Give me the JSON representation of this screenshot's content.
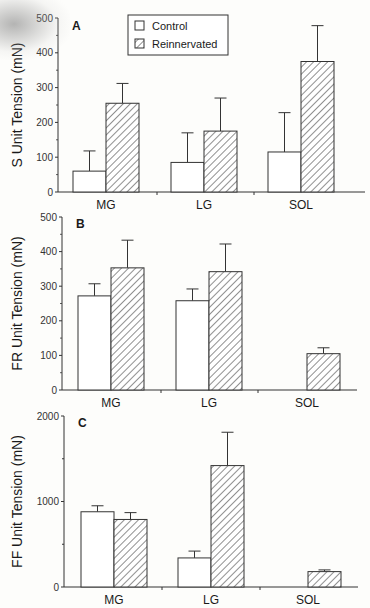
{
  "chart_data": [
    {
      "type": "bar",
      "panel": "A",
      "title": "",
      "xlabel": "",
      "ylabel": "S Unit Tension (mN)",
      "ylim": [
        0,
        500
      ],
      "yticks": [
        0,
        100,
        200,
        300,
        400,
        500
      ],
      "categories": [
        "MG",
        "LG",
        "SOL"
      ],
      "series": [
        {
          "name": "Control",
          "values": [
            60,
            85,
            115
          ],
          "error_upper": [
            118,
            170,
            228
          ]
        },
        {
          "name": "Reinnervated",
          "values": [
            255,
            175,
            375
          ],
          "error_upper": [
            312,
            270,
            478
          ]
        }
      ],
      "legend": {
        "position": "top-center",
        "entries": [
          "Control",
          "Reinnervated"
        ]
      },
      "grid": false
    },
    {
      "type": "bar",
      "panel": "B",
      "title": "",
      "xlabel": "",
      "ylabel": "FR Unit Tension (mN)",
      "ylim": [
        0,
        500
      ],
      "yticks": [
        0,
        100,
        200,
        300,
        400,
        500
      ],
      "categories": [
        "MG",
        "LG",
        "SOL"
      ],
      "series": [
        {
          "name": "Control",
          "values": [
            272,
            258,
            null
          ],
          "error_upper": [
            307,
            292,
            null
          ]
        },
        {
          "name": "Reinnervated",
          "values": [
            353,
            342,
            105
          ],
          "error_upper": [
            433,
            422,
            122
          ]
        }
      ],
      "grid": false
    },
    {
      "type": "bar",
      "panel": "C",
      "title": "",
      "xlabel": "",
      "ylabel": "FF Unit Tension (mN)",
      "ylim": [
        0,
        2000
      ],
      "yticks": [
        0,
        1000,
        2000
      ],
      "yminor_ticks": [
        500,
        1500
      ],
      "categories": [
        "MG",
        "LG",
        "SOL"
      ],
      "series": [
        {
          "name": "Control",
          "values": [
            880,
            340,
            null
          ],
          "error_upper": [
            950,
            420,
            null
          ]
        },
        {
          "name": "Reinnervated",
          "values": [
            790,
            1420,
            180
          ],
          "error_upper": [
            870,
            1810,
            200
          ]
        }
      ],
      "grid": false
    }
  ],
  "colors": {
    "control_fill": "#ffffff",
    "hatch": "#333333",
    "axis": "#333333",
    "text": "#1a1a1a"
  },
  "legend": {
    "control": "Control",
    "reinnervated": "Reinnervated"
  }
}
